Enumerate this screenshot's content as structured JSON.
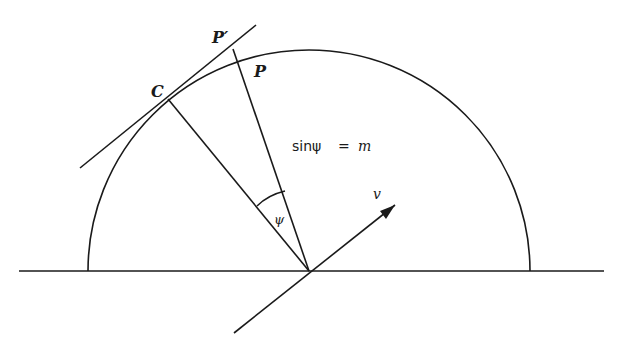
{
  "diagram": {
    "labels": {
      "point_p_prime": "P′",
      "point_p": "P",
      "point_c": "C",
      "angle": "ψ",
      "velocity": "v",
      "equation_lhs": "sinψ",
      "equation_eq": "=",
      "equation_rhs": "m"
    },
    "stroke_color": "#1a1a1a",
    "background": "#ffffff"
  }
}
